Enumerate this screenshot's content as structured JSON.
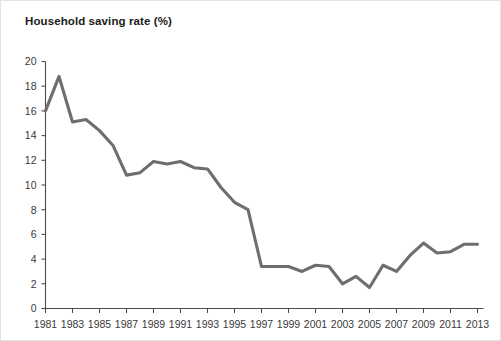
{
  "chart": {
    "title": "Household saving rate (%)"
  },
  "chart_data": {
    "type": "line",
    "title": "Household saving rate (%)",
    "subtitle": "",
    "xlabel": "",
    "ylabel": "",
    "xlim": [
      1981,
      2013
    ],
    "ylim": [
      0,
      20
    ],
    "grid": false,
    "legend": false,
    "legend_position": "none",
    "line_color": "#6e6e6e",
    "axis_color": "#4d4d4d",
    "y_ticks": [
      0,
      2,
      4,
      6,
      8,
      10,
      12,
      14,
      16,
      18,
      20
    ],
    "y_tick_labels": [
      "0",
      "2",
      "4",
      "6",
      "8",
      "10",
      "12",
      "14",
      "16",
      "18",
      "20"
    ],
    "x_ticks": [
      1981,
      1983,
      1985,
      1987,
      1989,
      1991,
      1993,
      1995,
      1997,
      1999,
      2001,
      2003,
      2005,
      2007,
      2009,
      2011,
      2013
    ],
    "x_tick_labels": [
      "1981",
      "1983",
      "1985",
      "1987",
      "1989",
      "1991",
      "1993",
      "1995",
      "1997",
      "1999",
      "2001",
      "2003",
      "2005",
      "2007",
      "2009",
      "2011",
      "2013"
    ],
    "x": [
      1981,
      1982,
      1983,
      1984,
      1985,
      1986,
      1987,
      1988,
      1989,
      1990,
      1991,
      1992,
      1993,
      1994,
      1995,
      1996,
      1997,
      1998,
      1999,
      2000,
      2001,
      2002,
      2003,
      2004,
      2005,
      2006,
      2007,
      2008,
      2009,
      2010,
      2011,
      2012,
      2013
    ],
    "series": [
      {
        "name": "Household saving rate",
        "values": [
          16.0,
          18.8,
          15.1,
          15.3,
          14.4,
          13.2,
          10.8,
          11.0,
          11.9,
          11.7,
          11.9,
          11.4,
          11.3,
          9.8,
          8.6,
          8.0,
          3.4,
          3.4,
          3.4,
          3.0,
          3.5,
          3.4,
          2.0,
          2.6,
          1.7,
          3.5,
          3.0,
          4.3,
          5.3,
          4.5,
          4.6,
          5.2,
          5.2
        ]
      }
    ]
  }
}
